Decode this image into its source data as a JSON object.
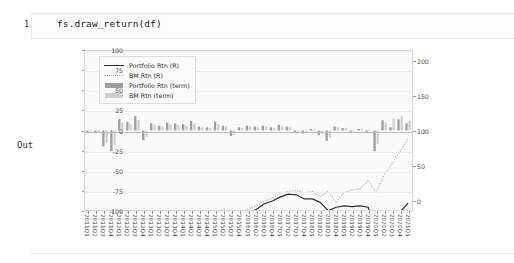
{
  "notebook": {
    "prompt_number": "1",
    "code": "fs.draw_return(df)",
    "output_label": "Out"
  },
  "legend": {
    "items": [
      {
        "label": "Portfolio Rtn (R)",
        "key": "solid-line",
        "color": "#2e2e2e"
      },
      {
        "label": "BM Rtn (R)",
        "key": "dotted-line",
        "color": "#b0b0b0"
      },
      {
        "label": "Portfolio Rtn (term)",
        "key": "dark-patch",
        "color": "#9e9e9e"
      },
      {
        "label": "BM Rtn (term)",
        "key": "light-patch",
        "color": "#cfcfcf"
      }
    ]
  },
  "chart_data": {
    "type": "line",
    "title": "",
    "xlabel": "",
    "ylabel": "",
    "grid": true,
    "legend_position": "upper-left",
    "axis_left": {
      "label": "term return (%)",
      "ticks": [
        100,
        75,
        50,
        25,
        0,
        -25,
        -50,
        -75,
        -100
      ],
      "ylim": [
        -100,
        100
      ]
    },
    "axis_right": {
      "label": "cumulative return (%)",
      "ticks": [
        200,
        150,
        100,
        50,
        0
      ],
      "ylim": [
        -15,
        215
      ]
    },
    "categories": [
      "2011Q1",
      "2011Q2",
      "2011Q3",
      "2011Q4",
      "2012Q1",
      "2012Q2",
      "2012Q3",
      "2012Q4",
      "2013Q1",
      "2013Q2",
      "2013Q3",
      "2013Q4",
      "2014Q1",
      "2014Q2",
      "2014Q3",
      "2014Q4",
      "2015Q1",
      "2015Q2",
      "2015Q3",
      "2015Q4",
      "2016Q1",
      "2016Q2",
      "2016Q3",
      "2016Q4",
      "2017Q1",
      "2017Q2",
      "2017Q3",
      "2017Q4",
      "2018Q1",
      "2018Q2",
      "2018Q3",
      "2018Q4",
      "2019Q1",
      "2019Q2",
      "2019Q3",
      "2019Q4",
      "2020Q1",
      "2020Q2",
      "2020Q3",
      "2020Q4",
      "2021Q1"
    ],
    "series": [
      {
        "name": "Portfolio Rtn (R)",
        "type": "line",
        "axis": "right",
        "style": "solid",
        "color": "#2e2e2e",
        "values": [
          -69,
          -70,
          -88,
          -96,
          -80,
          -74,
          -62,
          -66,
          -50,
          -44,
          -44,
          -43,
          -39,
          -33,
          -31,
          -30,
          -22,
          -20,
          -28,
          -25,
          -19,
          -14,
          -6,
          -2,
          4,
          8,
          7,
          1,
          1,
          -4,
          -16,
          -11,
          -9,
          -10,
          -9,
          -11,
          -47,
          -36,
          -34,
          -18,
          -5
        ]
      },
      {
        "name": "BM Rtn (R)",
        "type": "line",
        "axis": "right",
        "style": "dotted",
        "color": "#b0b0b0",
        "values": [
          -62,
          -66,
          -82,
          -76,
          -68,
          -65,
          -56,
          -54,
          -44,
          -42,
          -38,
          -36,
          -32,
          -28,
          -26,
          -24,
          -18,
          -14,
          -22,
          -19,
          -13,
          -9,
          -2,
          2,
          9,
          12,
          13,
          10,
          12,
          4,
          12,
          -4,
          10,
          14,
          16,
          28,
          10,
          36,
          52,
          70,
          88
        ]
      },
      {
        "name": "Portfolio Rtn (term)",
        "type": "bar",
        "axis": "left",
        "color": "#9e9e9e",
        "values": [
          -2,
          -3,
          -20,
          -26,
          14,
          11,
          18,
          -12,
          9,
          6,
          10,
          9,
          8,
          12,
          5,
          4,
          11,
          6,
          -7,
          4,
          6,
          5,
          6,
          4,
          7,
          5,
          -3,
          -4,
          2,
          -6,
          -13,
          5,
          3,
          -2,
          2,
          -2,
          -26,
          13,
          4,
          14,
          9
        ]
      },
      {
        "name": "BM Rtn (term)",
        "type": "bar",
        "axis": "left",
        "color": "#cfcfcf",
        "values": [
          -1,
          -2,
          -15,
          -18,
          10,
          8,
          13,
          -8,
          7,
          5,
          8,
          7,
          6,
          9,
          4,
          3,
          8,
          5,
          -5,
          3,
          5,
          4,
          5,
          3,
          6,
          4,
          -2,
          -3,
          2,
          -4,
          -9,
          4,
          3,
          -1,
          2,
          -1,
          -17,
          10,
          15,
          18,
          12
        ]
      }
    ]
  }
}
